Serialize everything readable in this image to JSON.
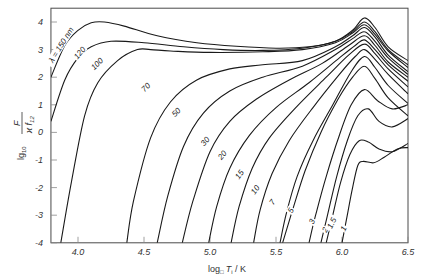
{
  "chart_data": {
    "type": "line",
    "title": "",
    "xlabel": "log₁₀ Tᵢ / K",
    "ylabel": "lg₁₀ F / (ϰ f₁₂)",
    "xlim": [
      3.795,
      6.5
    ],
    "ylim": [
      -4,
      4.5
    ],
    "grid": false,
    "legend": "none (inline curve labels)",
    "x_ticks": [
      "4.0",
      "4.5",
      "5.0",
      "5.5",
      "6.0",
      "6.5"
    ],
    "x_tick_values": [
      4.0,
      4.5,
      5.0,
      5.5,
      6.0,
      6.5
    ],
    "y_ticks": [
      "4",
      "3",
      "2",
      "1",
      "0",
      "-1",
      "-2",
      "-3",
      "-4"
    ],
    "y_tick_values": [
      4,
      3,
      2,
      1,
      0,
      -1,
      -2,
      -3,
      -4
    ],
    "series_parameter": "wavelength λ (nm)",
    "series": [
      {
        "name": "λ = 150 nm",
        "label_pos": [
          3.88,
          3.15,
          -58
        ],
        "points": [
          [
            3.795,
            2.0
          ],
          [
            3.9,
            3.15
          ],
          [
            4.0,
            3.7
          ],
          [
            4.1,
            3.97
          ],
          [
            4.2,
            4.0
          ],
          [
            4.35,
            3.85
          ],
          [
            4.6,
            3.5
          ],
          [
            4.9,
            3.25
          ],
          [
            5.2,
            3.12
          ],
          [
            5.5,
            3.05
          ],
          [
            5.75,
            3.1
          ],
          [
            5.95,
            3.3
          ],
          [
            6.08,
            3.7
          ],
          [
            6.17,
            4.15
          ],
          [
            6.25,
            3.8
          ],
          [
            6.35,
            3.1
          ],
          [
            6.5,
            2.6
          ]
        ]
      },
      {
        "name": "120",
        "label_pos": [
          4.02,
          2.85,
          -50
        ],
        "points": [
          [
            3.795,
            0.4
          ],
          [
            3.9,
            1.9
          ],
          [
            4.0,
            2.7
          ],
          [
            4.1,
            3.1
          ],
          [
            4.25,
            3.3
          ],
          [
            4.5,
            3.25
          ],
          [
            4.8,
            3.1
          ],
          [
            5.1,
            3.0
          ],
          [
            5.4,
            2.97
          ],
          [
            5.7,
            3.05
          ],
          [
            5.95,
            3.3
          ],
          [
            6.08,
            3.65
          ],
          [
            6.17,
            4.0
          ],
          [
            6.25,
            3.65
          ],
          [
            6.35,
            3.0
          ],
          [
            6.5,
            2.45
          ]
        ]
      },
      {
        "name": "100",
        "label_pos": [
          4.15,
          2.45,
          -45
        ],
        "points": [
          [
            3.87,
            -4.0
          ],
          [
            3.95,
            -1.8
          ],
          [
            4.05,
            0.6
          ],
          [
            4.15,
            1.8
          ],
          [
            4.3,
            2.6
          ],
          [
            4.45,
            3.0
          ],
          [
            4.55,
            3.0
          ],
          [
            4.7,
            2.95
          ],
          [
            5.0,
            2.9
          ],
          [
            5.4,
            2.92
          ],
          [
            5.7,
            3.0
          ],
          [
            5.95,
            3.25
          ],
          [
            6.08,
            3.6
          ],
          [
            6.17,
            3.9
          ],
          [
            6.25,
            3.55
          ],
          [
            6.35,
            2.95
          ],
          [
            6.5,
            2.35
          ]
        ]
      },
      {
        "name": "70",
        "label_pos": [
          4.52,
          1.6,
          -45
        ],
        "points": [
          [
            4.37,
            -4.0
          ],
          [
            4.42,
            -2.5
          ],
          [
            4.55,
            -0.2
          ],
          [
            4.7,
            1.1
          ],
          [
            4.9,
            1.9
          ],
          [
            5.15,
            2.3
          ],
          [
            5.4,
            2.45
          ],
          [
            5.7,
            2.6
          ],
          [
            5.95,
            3.1
          ],
          [
            6.08,
            3.5
          ],
          [
            6.17,
            3.8
          ],
          [
            6.25,
            3.45
          ],
          [
            6.35,
            2.8
          ],
          [
            6.5,
            2.2
          ]
        ]
      },
      {
        "name": "50",
        "label_pos": [
          4.75,
          0.7,
          -45
        ],
        "points": [
          [
            4.6,
            -4.0
          ],
          [
            4.68,
            -2.3
          ],
          [
            4.8,
            -0.5
          ],
          [
            4.95,
            0.7
          ],
          [
            5.15,
            1.5
          ],
          [
            5.4,
            2.0
          ],
          [
            5.7,
            2.4
          ],
          [
            5.95,
            3.0
          ],
          [
            6.08,
            3.4
          ],
          [
            6.17,
            3.65
          ],
          [
            6.25,
            3.3
          ],
          [
            6.35,
            2.7
          ],
          [
            6.5,
            2.1
          ]
        ]
      },
      {
        "name": "30",
        "label_pos": [
          4.97,
          -0.35,
          -50
        ],
        "points": [
          [
            4.79,
            -4.0
          ],
          [
            4.87,
            -2.5
          ],
          [
            5.0,
            -0.7
          ],
          [
            5.15,
            0.4
          ],
          [
            5.35,
            1.2
          ],
          [
            5.6,
            1.9
          ],
          [
            5.85,
            2.5
          ],
          [
            6.05,
            3.15
          ],
          [
            6.17,
            3.5
          ],
          [
            6.25,
            3.15
          ],
          [
            6.35,
            2.55
          ],
          [
            6.5,
            2.0
          ]
        ]
      },
      {
        "name": "20",
        "label_pos": [
          5.1,
          -0.85,
          -50
        ],
        "points": [
          [
            4.99,
            -4.0
          ],
          [
            5.05,
            -2.7
          ],
          [
            5.15,
            -1.3
          ],
          [
            5.3,
            -0.1
          ],
          [
            5.5,
            0.9
          ],
          [
            5.75,
            1.8
          ],
          [
            5.98,
            2.7
          ],
          [
            6.1,
            3.15
          ],
          [
            6.17,
            3.35
          ],
          [
            6.25,
            3.0
          ],
          [
            6.35,
            2.45
          ],
          [
            6.5,
            1.85
          ]
        ]
      },
      {
        "name": "15",
        "label_pos": [
          5.23,
          -1.55,
          -55
        ],
        "points": [
          [
            5.16,
            -4.0
          ],
          [
            5.22,
            -2.7
          ],
          [
            5.32,
            -1.3
          ],
          [
            5.45,
            -0.2
          ],
          [
            5.65,
            0.9
          ],
          [
            5.88,
            2.0
          ],
          [
            6.05,
            2.8
          ],
          [
            6.17,
            3.2
          ],
          [
            6.25,
            2.85
          ],
          [
            6.35,
            2.3
          ],
          [
            6.5,
            1.65
          ]
        ]
      },
      {
        "name": "10",
        "label_pos": [
          5.35,
          -2.1,
          -55
        ],
        "points": [
          [
            5.33,
            -4.0
          ],
          [
            5.38,
            -2.8
          ],
          [
            5.47,
            -1.5
          ],
          [
            5.6,
            -0.3
          ],
          [
            5.78,
            0.9
          ],
          [
            5.98,
            2.1
          ],
          [
            6.1,
            2.75
          ],
          [
            6.17,
            3.0
          ],
          [
            6.25,
            2.65
          ],
          [
            6.35,
            2.1
          ],
          [
            6.5,
            1.4
          ]
        ]
      },
      {
        "name": "7",
        "label_pos": [
          5.48,
          -2.55,
          -55
        ],
        "points": [
          [
            5.53,
            -4.0
          ],
          [
            5.58,
            -2.9
          ],
          [
            5.66,
            -1.6
          ],
          [
            5.78,
            -0.3
          ],
          [
            5.93,
            1.0
          ],
          [
            6.07,
            2.2
          ],
          [
            6.17,
            2.75
          ],
          [
            6.25,
            2.35
          ],
          [
            6.35,
            1.7
          ],
          [
            6.5,
            1.05
          ]
        ]
      },
      {
        "name": "5",
        "label_pos": [
          5.62,
          -2.85,
          -60
        ],
        "points": [
          [
            5.55,
            -4.0
          ],
          [
            5.62,
            -2.9
          ],
          [
            5.72,
            -1.4
          ],
          [
            5.84,
            0.0
          ],
          [
            5.97,
            1.2
          ],
          [
            6.08,
            2.0
          ],
          [
            6.17,
            2.4
          ],
          [
            6.25,
            1.95
          ],
          [
            6.35,
            1.25
          ],
          [
            6.5,
            0.6
          ]
        ]
      },
      {
        "name": "3",
        "label_pos": [
          5.78,
          -3.25,
          -62
        ],
        "points": [
          [
            5.75,
            -4.0
          ],
          [
            5.8,
            -3.0
          ],
          [
            5.88,
            -1.6
          ],
          [
            5.98,
            -0.1
          ],
          [
            6.07,
            1.0
          ],
          [
            6.17,
            1.55
          ],
          [
            6.27,
            1.15
          ],
          [
            6.38,
            0.85
          ],
          [
            6.5,
            1.0
          ]
        ]
      },
      {
        "name": "2",
        "label_pos": [
          5.88,
          -3.55,
          -62
        ],
        "points": [
          [
            5.84,
            -4.0
          ],
          [
            5.89,
            -3.0
          ],
          [
            5.96,
            -1.6
          ],
          [
            6.04,
            -0.3
          ],
          [
            6.12,
            0.6
          ],
          [
            6.2,
            0.85
          ],
          [
            6.28,
            0.4
          ],
          [
            6.38,
            0.2
          ],
          [
            6.5,
            0.5
          ]
        ]
      },
      {
        "name": "1.5",
        "label_pos": [
          5.93,
          -3.3,
          -65
        ],
        "points": [
          [
            5.88,
            -4.0
          ],
          [
            5.93,
            -3.0
          ],
          [
            5.99,
            -1.8
          ],
          [
            6.06,
            -0.8
          ],
          [
            6.13,
            -0.3
          ],
          [
            6.2,
            -0.35
          ],
          [
            6.28,
            -0.6
          ],
          [
            6.38,
            -0.7
          ],
          [
            6.5,
            -0.4
          ]
        ]
      },
      {
        "name": "1",
        "label_pos": [
          6.02,
          -3.5,
          -65
        ],
        "points": [
          [
            6.0,
            -4.0
          ],
          [
            6.04,
            -3.0
          ],
          [
            6.08,
            -2.0
          ],
          [
            6.12,
            -1.2
          ],
          [
            6.16,
            -1.05
          ],
          [
            6.24,
            -1.1
          ],
          [
            6.32,
            -0.9
          ],
          [
            6.42,
            -0.6
          ],
          [
            6.5,
            -0.55
          ]
        ]
      }
    ]
  },
  "axes": {
    "x_title_main": "log",
    "x_title_sub": "□",
    "x_title_rest": "T",
    "x_title_sub2": "i",
    "x_title_unit": " / K",
    "y_title_prefix": "lg",
    "y_title_sub": "10",
    "y_title_num": "F",
    "y_title_den": "ϰ f",
    "y_title_den_sub": "12"
  },
  "colors": {
    "line": "#1a1a1a",
    "axis": "#4a4a4a",
    "background": "#ffffff"
  }
}
